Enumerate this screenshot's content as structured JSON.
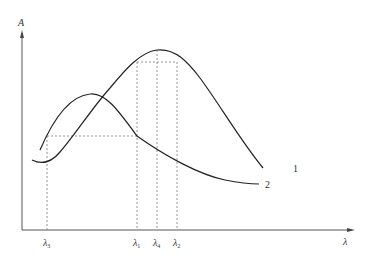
{
  "diagram": {
    "type": "spectral absorption curves",
    "axes": {
      "y_label": "A",
      "x_label": "λ"
    },
    "curves": [
      {
        "id": "1",
        "label": "1"
      },
      {
        "id": "2",
        "label": "2"
      }
    ],
    "x_markers": [
      {
        "symbol": "λ",
        "sub": "3"
      },
      {
        "symbol": "λ",
        "sub": "1"
      },
      {
        "symbol": "λ",
        "sub": "4"
      },
      {
        "symbol": "λ",
        "sub": "2"
      }
    ],
    "colors": {
      "line": "#222222",
      "axis": "#555555",
      "dash": "#777777"
    }
  }
}
